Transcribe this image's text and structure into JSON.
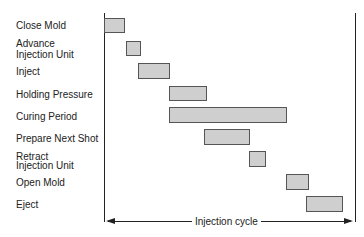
{
  "diagram": {
    "type": "gantt_timing_chart",
    "cycle_label": "Injection cycle",
    "steps": [
      {
        "label": "Close Mold",
        "start": 0,
        "end": 8.4
      },
      {
        "label": "Advance\nInjection Unit",
        "start": 8.4,
        "end": 14.7
      },
      {
        "label": "Inject",
        "start": 13.5,
        "end": 26.3
      },
      {
        "label": "Holding Pressure",
        "start": 25.9,
        "end": 41.0
      },
      {
        "label": "Curing Period",
        "start": 25.9,
        "end": 73.3
      },
      {
        "label": "Prepare Next Shot",
        "start": 39.8,
        "end": 58.2
      },
      {
        "label": "Retract\nInjection Unit",
        "start": 57.8,
        "end": 64.5
      },
      {
        "label": "Open Mold",
        "start": 72.9,
        "end": 82.1
      },
      {
        "label": "Eject",
        "start": 80.9,
        "end": 95.6
      }
    ]
  },
  "labels": {
    "close_mold": "Close Mold",
    "advance_1": "Advance",
    "advance_2": "Injection Unit",
    "inject": "Inject",
    "holding": "Holding Pressure",
    "curing": "Curing Period",
    "prepare": "Prepare Next Shot",
    "retract_1": "Retract",
    "retract_2": "Injection Unit",
    "open_mold": "Open Mold",
    "eject": "Eject",
    "cycle": "Injection cycle"
  }
}
